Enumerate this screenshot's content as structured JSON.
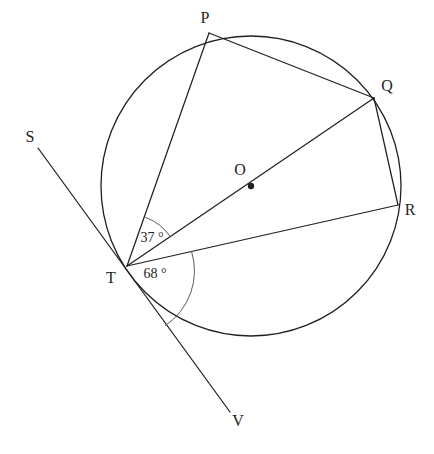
{
  "figure": {
    "type": "circle-geometry-diagram",
    "width": 434,
    "height": 454,
    "background_color": "#ffffff",
    "line_color": "#231f20",
    "arc_color": "#4a4a4a"
  },
  "circle": {
    "center_label": "O",
    "cx": 251,
    "cy": 186,
    "r": 150,
    "center_dot_r": 3.2
  },
  "points": [
    {
      "id": "P",
      "label": "P",
      "x": 209,
      "y": 33,
      "label_x": 205,
      "label_y": 19,
      "on_circle": true
    },
    {
      "id": "Q",
      "label": "Q",
      "x": 374,
      "y": 98,
      "label_x": 387,
      "label_y": 87,
      "on_circle": true
    },
    {
      "id": "R",
      "label": "R",
      "x": 398,
      "y": 205,
      "label_x": 410,
      "label_y": 211,
      "on_circle": true
    },
    {
      "id": "T",
      "label": "T",
      "x": 127,
      "y": 266,
      "label_x": 111,
      "label_y": 279,
      "on_circle": true
    },
    {
      "id": "O",
      "label": "O",
      "x": 251,
      "y": 186,
      "label_x": 240,
      "label_y": 171,
      "on_circle": false
    },
    {
      "id": "S",
      "label": "S",
      "x": 38,
      "y": 148,
      "label_x": 30,
      "label_y": 138,
      "on_circle": false
    },
    {
      "id": "V",
      "label": "V",
      "x": 230,
      "y": 412,
      "label_x": 238,
      "label_y": 422,
      "on_circle": false
    }
  ],
  "segments": [
    {
      "id": "SV",
      "name": "tangent-line-SV",
      "from": "S",
      "to": "V",
      "x1": 38,
      "y1": 148,
      "x2": 230,
      "y2": 412
    },
    {
      "id": "TP",
      "name": "chord-TP",
      "from": "T",
      "to": "P",
      "x1": 127,
      "y1": 266,
      "x2": 209,
      "y2": 33
    },
    {
      "id": "PQ",
      "name": "chord-PQ",
      "from": "P",
      "to": "Q",
      "x1": 209,
      "y1": 33,
      "x2": 374,
      "y2": 98
    },
    {
      "id": "TQ",
      "name": "diameter-TQ",
      "from": "T",
      "to": "Q",
      "x1": 127,
      "y1": 266,
      "x2": 374,
      "y2": 98
    },
    {
      "id": "TR",
      "name": "chord-TR",
      "from": "T",
      "to": "R",
      "x1": 127,
      "y1": 266,
      "x2": 398,
      "y2": 205
    },
    {
      "id": "QR",
      "name": "chord-QR",
      "from": "Q",
      "to": "R",
      "x1": 374,
      "y1": 98,
      "x2": 398,
      "y2": 205
    }
  ],
  "angles": [
    {
      "id": "angle-37",
      "name": "angle-PTQ",
      "value": "37",
      "unit": "°",
      "text": "37 °",
      "vertex": "T",
      "between": [
        "TP",
        "TQ"
      ],
      "arc_radius": 52,
      "arc_path": "M 145.3 217.3 A 52 52 0 0 1 170.8 237.3",
      "label_x": 152,
      "label_y": 239
    },
    {
      "id": "angle-68",
      "name": "angle-RTV",
      "value": "68",
      "unit": "°",
      "text": "68 °",
      "vertex": "T",
      "between": [
        "TR",
        "TV"
      ],
      "arc_radius": 66,
      "arc_path": "M 191.6 251.5 A 66 66 0 0 1 165.0 325.8",
      "label_x": 155,
      "label_y": 275
    }
  ]
}
